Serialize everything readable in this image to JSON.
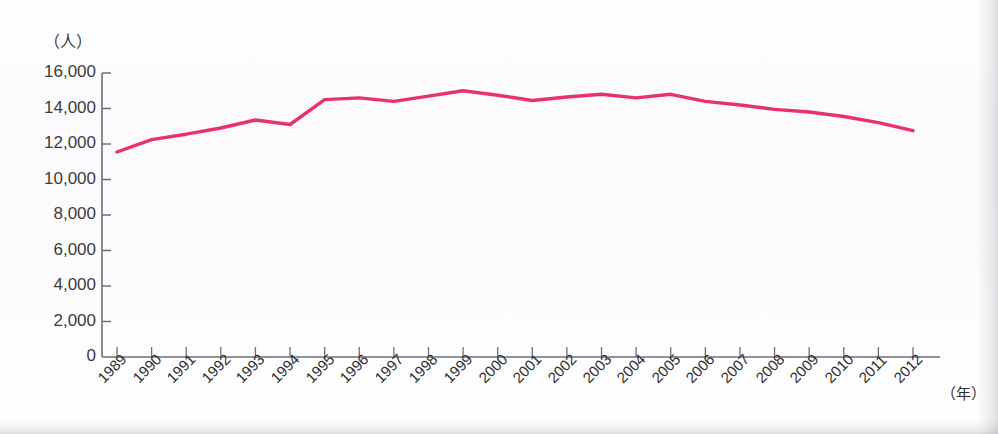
{
  "chart_data": {
    "type": "line",
    "title": "",
    "subtitle": "",
    "xlabel": "（年）",
    "ylabel": "（人）",
    "ylim": [
      0,
      16000
    ],
    "grid": false,
    "legend": "none",
    "yticks": [
      "16,000",
      "14,000",
      "12,000",
      "10,000",
      "8,000",
      "6,000",
      "4,000",
      "2,000",
      "0"
    ],
    "ytick_values": [
      16000,
      14000,
      12000,
      10000,
      8000,
      6000,
      4000,
      2000,
      0
    ],
    "categories": [
      "1989",
      "1990",
      "1991",
      "1992",
      "1993",
      "1994",
      "1995",
      "1996",
      "1997",
      "1998",
      "1999",
      "2000",
      "2001",
      "2002",
      "2003",
      "2004",
      "2005",
      "2006",
      "2007",
      "2008",
      "2009",
      "2010",
      "2011",
      "2012"
    ],
    "series": [
      {
        "name": "人数",
        "color": "#e8336a",
        "values": [
          11550,
          12250,
          12550,
          12900,
          13350,
          13100,
          14500,
          14600,
          14400,
          14700,
          15000,
          14750,
          14450,
          14650,
          14800,
          14600,
          14800,
          14400,
          14200,
          13950,
          13800,
          13550,
          13200,
          12750
        ]
      }
    ]
  },
  "axis": {
    "y_unit": "（人）",
    "x_unit": "（年）"
  },
  "colors": {
    "line": "#e8336a",
    "axis": "#6e6e76",
    "tick_text": "#3c3c3c"
  }
}
